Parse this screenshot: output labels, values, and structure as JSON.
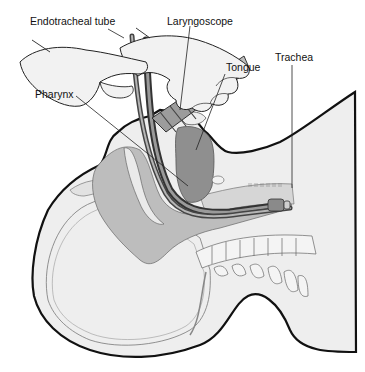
{
  "figure": {
    "labels": {
      "endotracheal_tube": "Endotracheal tube",
      "laryngoscope": "Laryngoscope",
      "tongue": "Tongue",
      "trachea": "Trachea",
      "pharynx": "Pharynx"
    },
    "colors": {
      "background": "#ffffff",
      "skin": "#eeeeee",
      "outline": "#111111",
      "airway_shade": "#bdbdbd",
      "tongue_shade": "#8f8f8f",
      "glove": "#f2f2f2",
      "tube": "#6a6a6a"
    }
  }
}
